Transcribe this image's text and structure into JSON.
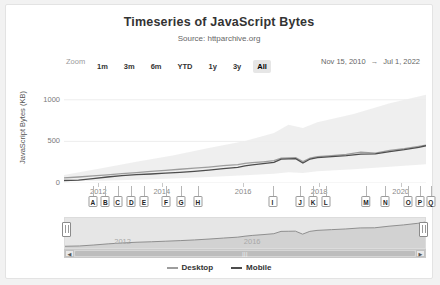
{
  "header": {
    "title": "Timeseries of JavaScript Bytes",
    "subtitle": "Source: httparchive.org"
  },
  "range_selector": {
    "label": "Zoom",
    "buttons": [
      {
        "label": "1m",
        "selected": false
      },
      {
        "label": "3m",
        "selected": false
      },
      {
        "label": "6m",
        "selected": false
      },
      {
        "label": "YTD",
        "selected": false
      },
      {
        "label": "1y",
        "selected": false
      },
      {
        "label": "3y",
        "selected": false
      },
      {
        "label": "All",
        "selected": true
      }
    ],
    "date_from": "Nov 15, 2010",
    "arrow": "→",
    "date_to": "Jul 1, 2022"
  },
  "legend": {
    "items": [
      {
        "label": "Desktop",
        "color": "#9d9d9d"
      },
      {
        "label": "Mobile",
        "color": "#4d4d4d"
      }
    ]
  },
  "navigator": {
    "years": [
      "2012",
      "2016"
    ],
    "left_handle": "navigator-left-handle",
    "right_handle": "navigator-right-handle",
    "scroll_left": "◀",
    "scroll_right": "▶",
    "scroll_grip": "|||"
  },
  "flags": [
    {
      "label": "A",
      "x": 8.0
    },
    {
      "label": "B",
      "x": 11.4
    },
    {
      "label": "C",
      "x": 14.8
    },
    {
      "label": "D",
      "x": 18.6
    },
    {
      "label": "E",
      "x": 22.1
    },
    {
      "label": "F",
      "x": 28.2
    },
    {
      "label": "G",
      "x": 32.3
    },
    {
      "label": "H",
      "x": 37.0
    },
    {
      "label": "I",
      "x": 57.6
    },
    {
      "label": "J",
      "x": 65.2
    },
    {
      "label": "K",
      "x": 68.8
    },
    {
      "label": "L",
      "x": 72.3
    },
    {
      "label": "M",
      "x": 83.4
    },
    {
      "label": "N",
      "x": 88.8
    },
    {
      "label": "O",
      "x": 95.1
    },
    {
      "label": "P",
      "x": 98.3
    },
    {
      "label": "Q",
      "x": 101.3
    }
  ],
  "chart_data": {
    "type": "line",
    "title": "Timeseries of JavaScript Bytes",
    "subtitle": "Source: httparchive.org",
    "xlabel": "",
    "ylabel": "JavaScript Bytes (KB)",
    "ylim": [
      0,
      1250
    ],
    "yticks": [
      0,
      500,
      1000
    ],
    "xticks": [
      "2012",
      "2014",
      "2016",
      "2018",
      "2020"
    ],
    "xtick_positions": [
      9.5,
      27.0,
      49.5,
      70.5,
      93.0
    ],
    "xlim": [
      "Nov 15, 2010",
      "Jul 1, 2022"
    ],
    "grid": true,
    "legend_position": "bottom",
    "series": [
      {
        "name": "Desktop",
        "color": "#9d9d9d",
        "x": [
          0,
          4,
          8,
          12,
          16,
          20,
          24,
          28,
          32,
          36,
          40,
          44,
          48,
          50,
          52,
          55,
          58,
          60,
          62,
          64,
          66,
          68,
          70,
          74,
          78,
          82,
          86,
          90,
          94,
          98,
          100
        ],
        "y": [
          62,
          72,
          85,
          98,
          112,
          125,
          140,
          152,
          165,
          178,
          192,
          208,
          222,
          236,
          244,
          255,
          268,
          300,
          302,
          305,
          258,
          300,
          318,
          330,
          345,
          372,
          360,
          392,
          412,
          440,
          455
        ]
      },
      {
        "name": "Mobile",
        "color": "#4d4d4d",
        "x": [
          0,
          4,
          8,
          12,
          16,
          20,
          24,
          28,
          32,
          36,
          40,
          44,
          48,
          50,
          52,
          55,
          58,
          60,
          62,
          64,
          66,
          68,
          70,
          74,
          78,
          82,
          86,
          90,
          94,
          98,
          100
        ],
        "y": [
          30,
          35,
          52,
          72,
          88,
          100,
          108,
          118,
          128,
          140,
          155,
          172,
          188,
          205,
          218,
          232,
          248,
          288,
          290,
          292,
          240,
          288,
          305,
          318,
          330,
          348,
          350,
          378,
          400,
          428,
          448
        ]
      }
    ],
    "band": {
      "name": "range-band",
      "color": "#ececec",
      "x": [
        0,
        10,
        20,
        30,
        40,
        50,
        58,
        62,
        66,
        70,
        80,
        90,
        100
      ],
      "upper": [
        95,
        175,
        255,
        330,
        420,
        505,
        600,
        700,
        660,
        730,
        830,
        960,
        1060
      ],
      "lower": [
        20,
        28,
        40,
        55,
        72,
        92,
        110,
        130,
        120,
        140,
        165,
        195,
        225
      ]
    }
  }
}
